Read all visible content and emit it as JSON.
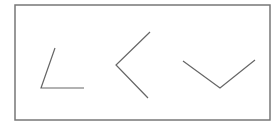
{
  "diagram": {
    "frame": {
      "x": 15,
      "y": 5,
      "width": 255,
      "height": 115,
      "stroke": "#777777"
    },
    "line_color": "#666666",
    "angles": [
      {
        "name": "acute-angle",
        "arm1": [
          55,
          48
        ],
        "vertex": [
          41,
          88
        ],
        "arm2": [
          84,
          88
        ]
      },
      {
        "name": "right-angle-open-left",
        "arm1": [
          150,
          32
        ],
        "vertex": [
          116,
          65
        ],
        "arm2": [
          148,
          98
        ]
      },
      {
        "name": "obtuse-angle-open-up",
        "arm1": [
          183,
          61
        ],
        "vertex": [
          220,
          88
        ],
        "arm2": [
          255,
          60
        ]
      }
    ]
  }
}
